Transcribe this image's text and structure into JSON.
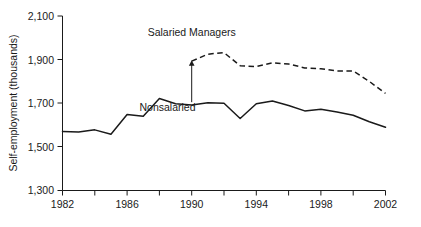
{
  "chart_data": {
    "type": "line",
    "title": "",
    "xlabel": "",
    "ylabel": "Self-employment (thousands)",
    "xlim": [
      1982,
      2002
    ],
    "ylim": [
      1300,
      2100
    ],
    "grid": false,
    "legend_position": "inline-annotation",
    "x_ticks_major": [
      "1982",
      "1986",
      "1990",
      "1994",
      "1998",
      "2002"
    ],
    "x_ticks_minor": [
      1984,
      1988,
      1992,
      1996,
      2000
    ],
    "y_ticks": [
      "1,300",
      "1,500",
      "1,700",
      "1,900",
      "2,100"
    ],
    "annotations": [
      {
        "name": "salaried-managers-label",
        "text": "Salaried Managers",
        "x": 1990,
        "y": 2010
      },
      {
        "name": "nonsalaried-label",
        "text": "Nonsalaried",
        "x": 1988.5,
        "y": 1665
      },
      {
        "name": "arrow-to-salaried-start",
        "from": [
          1990,
          1705
        ],
        "to": [
          1990,
          1895
        ]
      }
    ],
    "x": [
      1982,
      1983,
      1984,
      1985,
      1986,
      1987,
      1988,
      1989,
      1990,
      1991,
      1992,
      1993,
      1994,
      1995,
      1996,
      1997,
      1998,
      1999,
      2000,
      2001,
      2002
    ],
    "series": [
      {
        "name": "Nonsalaried",
        "style": "solid",
        "color": "#1a1a1a",
        "values": [
          1570,
          1568,
          1578,
          1558,
          1648,
          1640,
          1722,
          1698,
          1692,
          1702,
          1700,
          1630,
          1698,
          1710,
          1690,
          1665,
          1672,
          1660,
          1645,
          1615,
          1590
        ]
      },
      {
        "name": "Salaried Managers",
        "style": "dashed",
        "color": "#1a1a1a",
        "start_year": 1990,
        "values": [
          null,
          null,
          null,
          null,
          null,
          null,
          null,
          null,
          1893,
          1925,
          1932,
          1872,
          1868,
          1885,
          1880,
          1862,
          1858,
          1848,
          1848,
          1800,
          1745
        ]
      }
    ]
  },
  "axis": {
    "y_title": "Self-employment (thousands)"
  }
}
